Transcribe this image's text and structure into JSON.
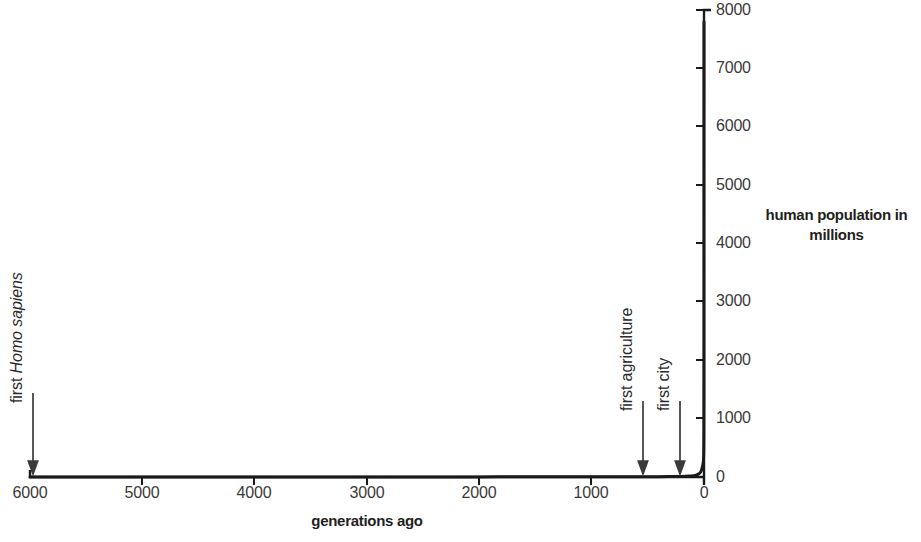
{
  "chart_data": {
    "type": "line",
    "title": "",
    "xlabel": "generations ago",
    "ylabel": "human population in millions",
    "ylabel_display_line1": "human population in",
    "ylabel_display_line2": "millions",
    "xlim": [
      6000,
      0
    ],
    "ylim": [
      0,
      8000
    ],
    "x_axis_reversed": true,
    "y_axis_position": "right",
    "grid": false,
    "legend": null,
    "xticks": [
      6000,
      5000,
      4000,
      3000,
      2000,
      1000,
      0
    ],
    "xtick_labels": [
      "6000",
      "5000",
      "4000",
      "3000",
      "2000",
      "1000",
      "0"
    ],
    "yticks": [
      0,
      1000,
      2000,
      3000,
      4000,
      5000,
      6000,
      7000,
      8000
    ],
    "ytick_labels": [
      "0",
      "1000",
      "2000",
      "3000",
      "4000",
      "5000",
      "6000",
      "7000",
      "8000"
    ],
    "series": [
      {
        "name": "human population",
        "color": "#1a1a1a",
        "line_width": 3,
        "x": [
          6000,
          5500,
          5000,
          4500,
          4000,
          3500,
          3000,
          2500,
          2000,
          1500,
          1200,
          1000,
          800,
          600,
          500,
          400,
          320,
          260,
          200,
          160,
          130,
          100,
          80,
          60,
          45,
          34,
          26,
          20,
          15,
          11,
          8,
          6,
          4.5,
          3.4,
          2.6,
          2,
          1.5,
          1,
          0.6,
          0.3,
          0
        ],
        "y": [
          1,
          1,
          1,
          1,
          1,
          1,
          2,
          2,
          2,
          3,
          3,
          4,
          4,
          5,
          5,
          6,
          7,
          8,
          10,
          12,
          15,
          20,
          27,
          40,
          55,
          75,
          100,
          130,
          170,
          200,
          230,
          265,
          300,
          350,
          425,
          500,
          610,
          790,
          1200,
          2500,
          7800
        ]
      }
    ],
    "annotations": [
      {
        "id": "first-homo-sapiens",
        "text_prefix": "first ",
        "text_scientific": "Homo sapiens",
        "full_text": "first Homo sapiens",
        "x_value": 6000,
        "orientation": "vertical",
        "marker": "down-arrow"
      },
      {
        "id": "first-agriculture",
        "text_prefix": "first agriculture",
        "text_scientific": "",
        "full_text": "first agriculture",
        "x_value": 550,
        "orientation": "vertical",
        "marker": "down-arrow"
      },
      {
        "id": "first-city",
        "text_prefix": "first city",
        "text_scientific": "",
        "full_text": "first city",
        "x_value": 220,
        "orientation": "vertical",
        "marker": "down-arrow"
      }
    ]
  }
}
